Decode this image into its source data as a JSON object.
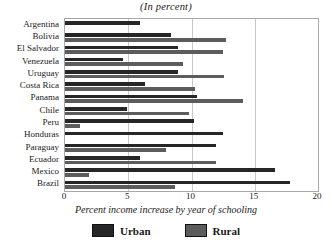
{
  "chart_data": {
    "type": "bar",
    "orientation": "horizontal",
    "title": "(In percent)",
    "xlabel": "Percent income increase by year of schooling",
    "ylabel": "",
    "xlim": [
      0,
      20
    ],
    "xticks": [
      0,
      5,
      10,
      15,
      20
    ],
    "grid": true,
    "legend_position": "bottom",
    "categories": [
      "Argentina",
      "Bolivia",
      "El Salvador",
      "Venezuela",
      "Uruguay",
      "Costa Rica",
      "Panama",
      "Chile",
      "Peru",
      "Honduras",
      "Paraguay",
      "Ecuador",
      "Mexico",
      "Brazil"
    ],
    "series": [
      {
        "name": "Urban",
        "color": "#262626",
        "values": [
          5.9,
          8.4,
          8.9,
          4.6,
          8.9,
          6.3,
          10.4,
          4.9,
          10.2,
          12.5,
          11.9,
          5.9,
          16.6,
          17.8
        ]
      },
      {
        "name": "Rural",
        "color": "#5c5c5c",
        "values": [
          0.0,
          12.7,
          12.5,
          9.3,
          12.6,
          10.3,
          14.1,
          9.8,
          1.2,
          0.0,
          8.0,
          11.9,
          1.9,
          8.7
        ]
      }
    ]
  },
  "legend": {
    "items": [
      {
        "label": "Urban",
        "color": "#262626"
      },
      {
        "label": "Rural",
        "color": "#5c5c5c"
      }
    ]
  }
}
